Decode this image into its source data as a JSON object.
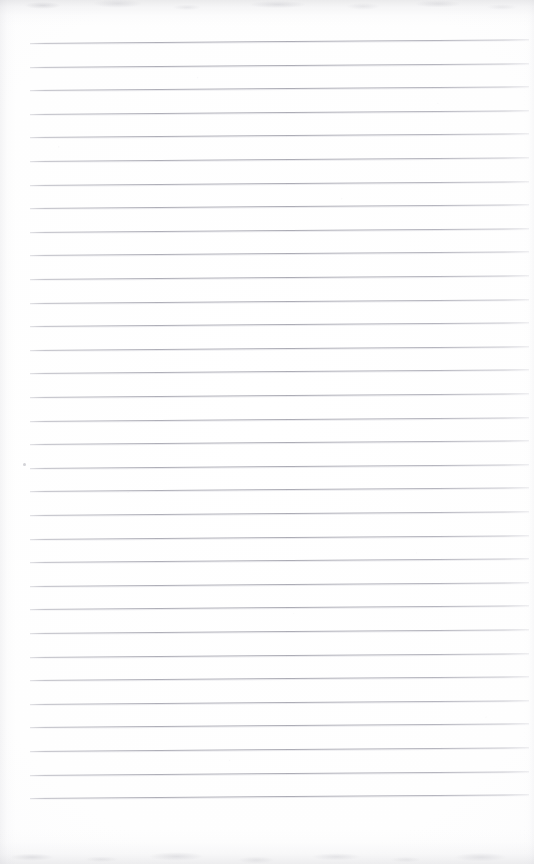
{
  "document": {
    "kind": "scanned-ruled-notebook-page",
    "page_width_px": 534,
    "page_height_px": 864,
    "background_color": "#ffffff",
    "paper_color": "#fdfdfe",
    "text_content": "",
    "visible_text": "none — the page is blank"
  },
  "ruling": {
    "line_color": "#acacb5",
    "line_count": 33,
    "line_spacing_px": 23.4,
    "first_line_y_px": 43,
    "last_line_y_px": 798,
    "line_start_x_px": 30,
    "line_end_x_px": 529,
    "line_thickness_px": 1,
    "skew_degrees": -0.42,
    "lines": [
      {
        "index": 1,
        "y": 43.0
      },
      {
        "index": 2,
        "y": 66.6
      },
      {
        "index": 3,
        "y": 90.2
      },
      {
        "index": 4,
        "y": 113.8
      },
      {
        "index": 5,
        "y": 137.4
      },
      {
        "index": 6,
        "y": 161.0
      },
      {
        "index": 7,
        "y": 184.6
      },
      {
        "index": 8,
        "y": 208.2
      },
      {
        "index": 9,
        "y": 231.8
      },
      {
        "index": 10,
        "y": 255.4
      },
      {
        "index": 11,
        "y": 279.0
      },
      {
        "index": 12,
        "y": 302.6
      },
      {
        "index": 13,
        "y": 326.2
      },
      {
        "index": 14,
        "y": 349.8
      },
      {
        "index": 15,
        "y": 373.4
      },
      {
        "index": 16,
        "y": 397.0
      },
      {
        "index": 17,
        "y": 420.6
      },
      {
        "index": 18,
        "y": 444.2
      },
      {
        "index": 19,
        "y": 467.8
      },
      {
        "index": 20,
        "y": 491.4
      },
      {
        "index": 21,
        "y": 515.0
      },
      {
        "index": 22,
        "y": 538.6
      },
      {
        "index": 23,
        "y": 562.2
      },
      {
        "index": 24,
        "y": 585.8
      },
      {
        "index": 25,
        "y": 609.4
      },
      {
        "index": 26,
        "y": 633.0
      },
      {
        "index": 27,
        "y": 656.6
      },
      {
        "index": 28,
        "y": 680.2
      },
      {
        "index": 29,
        "y": 703.8
      },
      {
        "index": 30,
        "y": 727.4
      },
      {
        "index": 31,
        "y": 751.0
      },
      {
        "index": 32,
        "y": 774.6
      },
      {
        "index": 33,
        "y": 798.2
      }
    ]
  },
  "artifacts": {
    "top_edge_shadow": true,
    "bottom_edge_shadow": true,
    "left_edge_shading": true,
    "right_edge_shading": true,
    "specks": [
      {
        "x": 23,
        "y": 463,
        "size": 3
      }
    ]
  }
}
